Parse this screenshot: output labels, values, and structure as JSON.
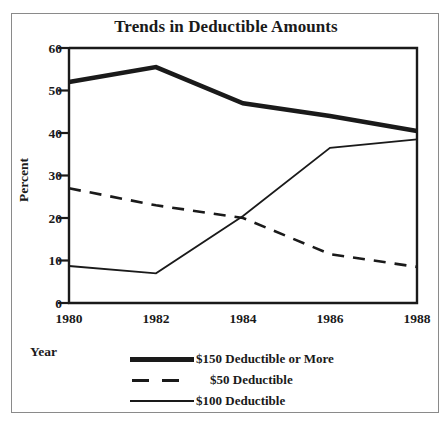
{
  "chart_data": {
    "type": "line",
    "title": "Trends in Deductible Amounts",
    "xlabel": "Year",
    "ylabel": "Percent",
    "x": [
      1980,
      1982,
      1984,
      1986,
      1988
    ],
    "xtick_labels": [
      "1980",
      "1982",
      "1984",
      "1986",
      "1988"
    ],
    "ytick_labels": [
      "0",
      "10",
      "20",
      "30",
      "40",
      "50",
      "60"
    ],
    "yticks": [
      0,
      10,
      20,
      30,
      40,
      50,
      60
    ],
    "ylim": [
      0,
      60
    ],
    "xlim": [
      1980,
      1988
    ],
    "grid": false,
    "legend_position": "below-axes",
    "series": [
      {
        "name": "$150 Deductible or More",
        "style": "thick-solid",
        "values": [
          52,
          55.5,
          47,
          44,
          40.5
        ]
      },
      {
        "name": "$50 Deductible",
        "style": "dashed",
        "values": [
          27,
          23,
          20,
          11.5,
          8.5
        ]
      },
      {
        "name": "$100 Deductible",
        "style": "thin-solid",
        "values": [
          8.7,
          7,
          20.5,
          36.5,
          38.5
        ]
      }
    ]
  },
  "legend": {
    "entries": [
      {
        "label": "$150 Deductible or More"
      },
      {
        "label": "$50 Deductible"
      },
      {
        "label": "$100 Deductible"
      }
    ]
  },
  "colors": {
    "ink": "#1a1a1a",
    "frame": "#8a8a8a",
    "background": "#ffffff"
  }
}
